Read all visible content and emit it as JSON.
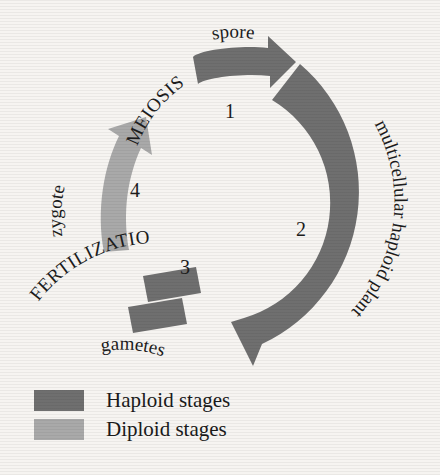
{
  "diagram": {
    "colors": {
      "haploid": "#6f6f6f",
      "diploid": "#a9a9a9",
      "background": "#f6f4f1",
      "text": "#1c1c1c"
    },
    "stages": [
      {
        "number": "1",
        "label": "spore",
        "process": "MEIOSIS",
        "ploidy": "haploid",
        "arrow_color": "#6f6f6f"
      },
      {
        "number": "2",
        "label": "multicellular haploid plant",
        "process": "",
        "ploidy": "haploid",
        "arrow_color": "#6f6f6f"
      },
      {
        "number": "3",
        "label": "gametes",
        "process": "FERTILIZATION",
        "ploidy": "haploid",
        "arrow_color": "#6f6f6f"
      },
      {
        "number": "4",
        "label": "zygote",
        "process": "",
        "ploidy": "diploid",
        "arrow_color": "#a9a9a9"
      }
    ],
    "labels": {
      "spore": "spore",
      "meiosis": "MEIOSIS",
      "multicellular_haploid_plant": "multicellular haploid plant",
      "gametes": "gametes",
      "fertilization": "FERTILIZATION",
      "zygote": "zygote",
      "num1": "1",
      "num2": "2",
      "num3": "3",
      "num4": "4"
    }
  },
  "legend": {
    "items": [
      {
        "label": "Haploid stages",
        "color": "#6f6f6f"
      },
      {
        "label": "Diploid stages",
        "color": "#a9a9a9"
      }
    ]
  }
}
